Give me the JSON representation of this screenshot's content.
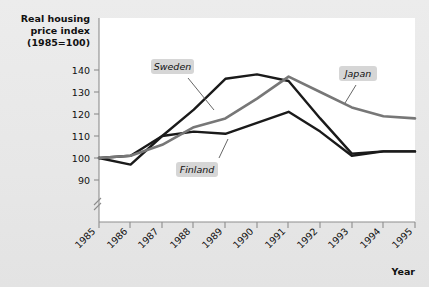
{
  "figure": {
    "background_color": "#e9e9e9",
    "plot_background_color": "#ffffff",
    "axis_color": "#8d8d8d"
  },
  "chart_data": {
    "type": "line",
    "title": "",
    "ylabel": "Real housing price index (1985=100)",
    "ylabel_lines": [
      "Real housing",
      "price index",
      "(1985=100)"
    ],
    "xlabel": "Year",
    "x": [
      1985,
      1986,
      1987,
      1988,
      1989,
      1990,
      1991,
      1992,
      1993,
      1994,
      1995
    ],
    "xticklabels": [
      "1985",
      "1986",
      "1987",
      "1988",
      "1989",
      "1990",
      "1991",
      "1992",
      "1993",
      "1994",
      "1995"
    ],
    "yticks": [
      90,
      100,
      110,
      120,
      130,
      140
    ],
    "yticklabels": [
      "90",
      "100",
      "110",
      "120",
      "130",
      "140"
    ],
    "ylim": [
      86,
      145
    ],
    "axis_break": true,
    "grid": false,
    "legend_position": "inline-annotations",
    "series": [
      {
        "name": "Sweden",
        "color": "#1a1a1a",
        "values": [
          100,
          101,
          110,
          122,
          136,
          138,
          135,
          118,
          102,
          103,
          103
        ]
      },
      {
        "name": "Finland",
        "color": "#1a1a1a",
        "values": [
          100,
          97,
          110,
          112,
          111,
          116,
          121,
          112,
          101,
          103,
          103
        ]
      },
      {
        "name": "Japan",
        "color": "#777777",
        "values": [
          100,
          101,
          106,
          114,
          118,
          127,
          137,
          130,
          123,
          119,
          118
        ]
      }
    ],
    "annotations": [
      {
        "text": "Sweden",
        "series": "Sweden"
      },
      {
        "text": "Finland",
        "series": "Finland"
      },
      {
        "text": "Japan",
        "series": "Japan"
      }
    ]
  }
}
